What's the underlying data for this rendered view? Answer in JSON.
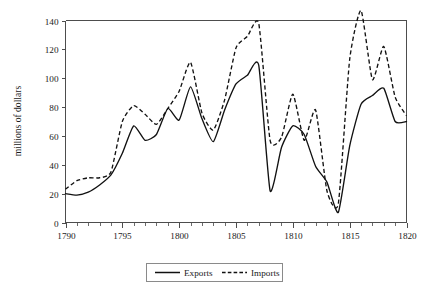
{
  "chart_data": {
    "type": "line",
    "title": "",
    "xlabel": "",
    "ylabel": "millions of dollars",
    "xlim": [
      1790,
      1820
    ],
    "ylim": [
      0,
      140
    ],
    "ytick_step": 20,
    "xtick_step": 5,
    "x_minor_step": 1,
    "grid": false,
    "legend_position": "bottom-center",
    "x": [
      1790,
      1791,
      1792,
      1793,
      1794,
      1795,
      1796,
      1797,
      1798,
      1799,
      1800,
      1801,
      1802,
      1803,
      1804,
      1805,
      1806,
      1807,
      1808,
      1809,
      1810,
      1811,
      1812,
      1813,
      1814,
      1815,
      1816,
      1817,
      1818,
      1819,
      1820
    ],
    "xticklabels": [
      "1790",
      "1795",
      "1800",
      "1805",
      "1810",
      "1815",
      "1820"
    ],
    "yticklabels": [
      "0",
      "20",
      "40",
      "60",
      "80",
      "100",
      "120",
      "140"
    ],
    "series": [
      {
        "name": "Exports",
        "style": "solid",
        "color": "#111111",
        "values": [
          20,
          19,
          21,
          26,
          33,
          48,
          67,
          57,
          61,
          79,
          71,
          94,
          72,
          56,
          78,
          96,
          102,
          109,
          22,
          52,
          67,
          61,
          39,
          28,
          7,
          53,
          82,
          88,
          93,
          70,
          70
        ]
      },
      {
        "name": "Imports",
        "style": "dashed",
        "color": "#111111",
        "values": [
          23,
          29,
          31,
          31,
          35,
          70,
          81,
          75,
          68,
          79,
          91,
          111,
          76,
          64,
          85,
          121,
          129,
          138,
          57,
          59,
          89,
          57,
          78,
          22,
          13,
          113,
          147,
          99,
          122,
          87,
          74
        ]
      }
    ],
    "legend": [
      {
        "label": "Exports",
        "style": "solid"
      },
      {
        "label": "Imports",
        "style": "dashed"
      }
    ]
  }
}
